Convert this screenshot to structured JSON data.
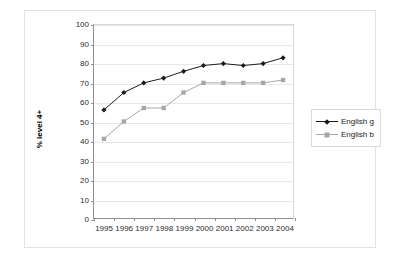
{
  "chart_data": {
    "type": "line",
    "title": "",
    "xlabel": "",
    "ylabel": "% level 4+",
    "categories": [
      "1995",
      "1996",
      "1997",
      "1998",
      "1999",
      "2000",
      "2001",
      "2002",
      "2003",
      "2004"
    ],
    "x": [
      1995,
      1996,
      1997,
      1998,
      1999,
      2000,
      2001,
      2002,
      2003,
      2004
    ],
    "ylim": [
      0,
      100
    ],
    "ytick_step": 10,
    "yticks": [
      "0",
      "10",
      "20",
      "30",
      "40",
      "50",
      "60",
      "70",
      "80",
      "90",
      "100"
    ],
    "grid": "horizontal",
    "legend_position": "right",
    "series": [
      {
        "name": "English g",
        "color": "#1a1a1a",
        "marker": "diamond",
        "values": [
          56,
          65,
          70,
          72.5,
          76,
          79,
          80,
          79,
          80,
          83
        ]
      },
      {
        "name": "English b",
        "color": "#a6a6a6",
        "marker": "square",
        "values": [
          41,
          50,
          57,
          57,
          65,
          70,
          70,
          70,
          70,
          71.5
        ]
      }
    ]
  },
  "legend": {
    "items": [
      {
        "label": "English g"
      },
      {
        "label": "English b"
      }
    ]
  },
  "colors": {
    "series_g": "#1a1a1a",
    "series_b": "#a6a6a6",
    "axis": "#8f8f8f",
    "gridline": "#e8e8e8",
    "frame_border": "#e2e2e2",
    "text": "#2b2b2b",
    "background": "#ffffff"
  }
}
